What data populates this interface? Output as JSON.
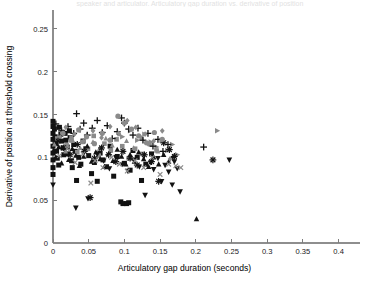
{
  "figure": {
    "width": 380,
    "height": 292,
    "background": "#ffffff",
    "top_caption": "speaker and articulator. Articulatory gap duration vs. derivative of position",
    "bottom_caption": ""
  },
  "plot_area": {
    "left": 53,
    "top": 10,
    "right": 360,
    "bottom": 243,
    "axis_color": "#8e8e8e"
  },
  "chart_data": {
    "type": "scatter",
    "title": "",
    "xlabel": "Articulatory gap duration (seconds)",
    "ylabel": "Derivative of position at threshold crossing",
    "xlim": [
      0,
      0.43
    ],
    "ylim": [
      0,
      0.272
    ],
    "xticks": [
      0,
      0.05,
      0.1,
      0.15,
      0.2,
      0.25,
      0.3,
      0.35,
      0.4
    ],
    "xticklabels": [
      "0",
      "0.05",
      "0.1",
      "0.15",
      "0.2",
      "0.25",
      "0.3",
      "0.35",
      "0.4"
    ],
    "yticks": [
      0,
      0.05,
      0.1,
      0.15,
      0.2,
      0.25
    ],
    "yticklabels": [
      "0",
      "0.05",
      "0.1",
      "0.15",
      "0.2",
      "0.25"
    ],
    "grid": false,
    "legend": "none",
    "marker_colors": {
      "black": "#121212",
      "gray": "#8a8a8a",
      "dark_gray": "#565656"
    },
    "series": [
      {
        "name": "square-black",
        "marker": "square",
        "color": "#121212",
        "size": 5.0,
        "points": [
          [
            0.0,
            0.142
          ],
          [
            0.0,
            0.136
          ],
          [
            0.0,
            0.128
          ],
          [
            0.0,
            0.121
          ],
          [
            0.0,
            0.113
          ],
          [
            0.0,
            0.105
          ],
          [
            0.0,
            0.097
          ],
          [
            0.0,
            0.088
          ],
          [
            0.0,
            0.08
          ],
          [
            0.002,
            0.133
          ],
          [
            0.003,
            0.124
          ],
          [
            0.004,
            0.116
          ],
          [
            0.005,
            0.107
          ],
          [
            0.006,
            0.099
          ],
          [
            0.008,
            0.091
          ],
          [
            0.009,
            0.135
          ],
          [
            0.011,
            0.127
          ],
          [
            0.012,
            0.119
          ],
          [
            0.014,
            0.111
          ],
          [
            0.015,
            0.103
          ],
          [
            0.017,
            0.128
          ],
          [
            0.018,
            0.12
          ],
          [
            0.02,
            0.112
          ],
          [
            0.021,
            0.104
          ],
          [
            0.023,
            0.131
          ],
          [
            0.024,
            0.123
          ],
          [
            0.026,
            0.096
          ],
          [
            0.027,
            0.088
          ],
          [
            0.029,
            0.115
          ],
          [
            0.031,
            0.107
          ],
          [
            0.033,
            0.073
          ],
          [
            0.036,
            0.1
          ],
          [
            0.039,
            0.092
          ],
          [
            0.042,
            0.119
          ],
          [
            0.046,
            0.11
          ],
          [
            0.05,
            0.102
          ],
          [
            0.054,
            0.081
          ],
          [
            0.058,
            0.094
          ],
          [
            0.062,
            0.072
          ],
          [
            0.066,
            0.105
          ],
          [
            0.07,
            0.097
          ],
          [
            0.075,
            0.089
          ],
          [
            0.08,
            0.113
          ],
          [
            0.085,
            0.078
          ],
          [
            0.09,
            0.101
          ],
          [
            0.095,
            0.048
          ],
          [
            0.098,
            0.046
          ],
          [
            0.1,
            0.093
          ],
          [
            0.103,
            0.046
          ],
          [
            0.106,
            0.047
          ],
          [
            0.108,
            0.085
          ],
          [
            0.112,
            0.108
          ],
          [
            0.118,
            0.1
          ],
          [
            0.124,
            0.073
          ],
          [
            0.13,
            0.092
          ],
          [
            0.138,
            0.104
          ]
        ]
      },
      {
        "name": "square-gray",
        "marker": "square",
        "color": "#8a8a8a",
        "size": 4.6,
        "points": [
          [
            0.006,
            0.122
          ],
          [
            0.013,
            0.13
          ],
          [
            0.019,
            0.114
          ],
          [
            0.026,
            0.123
          ],
          [
            0.034,
            0.106
          ],
          [
            0.041,
            0.118
          ],
          [
            0.049,
            0.11
          ],
          [
            0.057,
            0.125
          ],
          [
            0.064,
            0.102
          ],
          [
            0.072,
            0.116
          ],
          [
            0.081,
            0.108
          ],
          [
            0.089,
            0.121
          ],
          [
            0.097,
            0.113
          ],
          [
            0.106,
            0.099
          ],
          [
            0.115,
            0.11
          ],
          [
            0.125,
            0.104
          ],
          [
            0.135,
            0.116
          ],
          [
            0.145,
            0.108
          ]
        ]
      },
      {
        "name": "triangle-up-black",
        "marker": "triangle-up",
        "color": "#121212",
        "size": 5.2,
        "points": [
          [
            0.001,
            0.108
          ],
          [
            0.004,
            0.1
          ],
          [
            0.008,
            0.112
          ],
          [
            0.012,
            0.093
          ],
          [
            0.017,
            0.105
          ],
          [
            0.022,
            0.097
          ],
          [
            0.027,
            0.11
          ],
          [
            0.032,
            0.102
          ],
          [
            0.037,
            0.09
          ],
          [
            0.043,
            0.101
          ],
          [
            0.048,
            0.113
          ],
          [
            0.054,
            0.095
          ],
          [
            0.06,
            0.106
          ],
          [
            0.066,
            0.098
          ],
          [
            0.072,
            0.089
          ],
          [
            0.078,
            0.104
          ],
          [
            0.084,
            0.096
          ],
          [
            0.09,
            0.109
          ],
          [
            0.096,
            0.101
          ],
          [
            0.102,
            0.092
          ],
          [
            0.108,
            0.103
          ],
          [
            0.114,
            0.095
          ],
          [
            0.12,
            0.106
          ],
          [
            0.127,
            0.098
          ],
          [
            0.134,
            0.089
          ],
          [
            0.141,
            0.1
          ],
          [
            0.148,
            0.092
          ],
          [
            0.155,
            0.103
          ],
          [
            0.162,
            0.095
          ],
          [
            0.201,
            0.028
          ]
        ]
      },
      {
        "name": "triangle-up-gray",
        "marker": "triangle-up",
        "color": "#8a8a8a",
        "size": 4.8,
        "points": [
          [
            0.002,
            0.115
          ],
          [
            0.01,
            0.124
          ],
          [
            0.018,
            0.107
          ],
          [
            0.028,
            0.119
          ],
          [
            0.038,
            0.111
          ],
          [
            0.047,
            0.126
          ],
          [
            0.056,
            0.118
          ],
          [
            0.065,
            0.11
          ],
          [
            0.074,
            0.122
          ],
          [
            0.083,
            0.114
          ],
          [
            0.093,
            0.127
          ],
          [
            0.103,
            0.119
          ],
          [
            0.113,
            0.111
          ],
          [
            0.124,
            0.123
          ],
          [
            0.136,
            0.115
          ],
          [
            0.147,
            0.107
          ]
        ]
      },
      {
        "name": "triangle-down-black",
        "marker": "triangle-down",
        "color": "#121212",
        "size": 5.4,
        "points": [
          [
            0.0,
            0.068
          ],
          [
            0.032,
            0.041
          ],
          [
            0.049,
            0.052
          ],
          [
            0.062,
            0.104
          ],
          [
            0.071,
            0.096
          ],
          [
            0.079,
            0.087
          ],
          [
            0.088,
            0.1
          ],
          [
            0.097,
            0.092
          ],
          [
            0.105,
            0.084
          ],
          [
            0.113,
            0.097
          ],
          [
            0.121,
            0.089
          ],
          [
            0.129,
            0.056
          ],
          [
            0.137,
            0.094
          ],
          [
            0.141,
            0.086
          ],
          [
            0.147,
            0.099
          ],
          [
            0.152,
            0.072
          ],
          [
            0.157,
            0.091
          ],
          [
            0.162,
            0.083
          ],
          [
            0.167,
            0.068
          ],
          [
            0.17,
            0.095
          ],
          [
            0.174,
            0.087
          ],
          [
            0.178,
            0.06
          ],
          [
            0.247,
            0.097
          ]
        ]
      },
      {
        "name": "triangle-right-gray",
        "marker": "triangle-right",
        "color": "#8a8a8a",
        "size": 5.2,
        "points": [
          [
            0.097,
            0.124
          ],
          [
            0.108,
            0.131
          ],
          [
            0.118,
            0.12
          ],
          [
            0.128,
            0.127
          ],
          [
            0.137,
            0.118
          ],
          [
            0.145,
            0.112
          ],
          [
            0.152,
            0.12
          ],
          [
            0.16,
            0.108
          ],
          [
            0.167,
            0.115
          ],
          [
            0.174,
            0.103
          ],
          [
            0.23,
            0.131
          ]
        ]
      },
      {
        "name": "plus-black",
        "marker": "plus",
        "color": "#121212",
        "size": 5.6,
        "points": [
          [
            0.004,
            0.139
          ],
          [
            0.012,
            0.131
          ],
          [
            0.021,
            0.136
          ],
          [
            0.029,
            0.128
          ],
          [
            0.033,
            0.151
          ],
          [
            0.038,
            0.133
          ],
          [
            0.043,
            0.14
          ],
          [
            0.048,
            0.126
          ],
          [
            0.055,
            0.134
          ],
          [
            0.062,
            0.143
          ],
          [
            0.069,
            0.129
          ],
          [
            0.076,
            0.137
          ],
          [
            0.083,
            0.122
          ],
          [
            0.09,
            0.13
          ],
          [
            0.096,
            0.146
          ],
          [
            0.1,
            0.14
          ],
          [
            0.106,
            0.133
          ],
          [
            0.112,
            0.126
          ],
          [
            0.119,
            0.134
          ],
          [
            0.126,
            0.12
          ],
          [
            0.133,
            0.128
          ],
          [
            0.14,
            0.113
          ],
          [
            0.147,
            0.121
          ],
          [
            0.154,
            0.107
          ],
          [
            0.161,
            0.115
          ],
          [
            0.168,
            0.1
          ],
          [
            0.211,
            0.112
          ]
        ]
      },
      {
        "name": "star-black",
        "marker": "star",
        "color": "#121212",
        "size": 5.4,
        "points": [
          [
            0.007,
            0.119
          ],
          [
            0.015,
            0.111
          ],
          [
            0.024,
            0.103
          ],
          [
            0.034,
            0.115
          ],
          [
            0.044,
            0.107
          ],
          [
            0.052,
            0.053
          ],
          [
            0.058,
            0.099
          ],
          [
            0.068,
            0.111
          ],
          [
            0.078,
            0.103
          ],
          [
            0.088,
            0.095
          ],
          [
            0.098,
            0.107
          ],
          [
            0.108,
            0.099
          ],
          [
            0.118,
            0.091
          ],
          [
            0.128,
            0.103
          ],
          [
            0.138,
            0.095
          ],
          [
            0.148,
            0.072
          ],
          [
            0.155,
            0.117
          ],
          [
            0.163,
            0.109
          ],
          [
            0.17,
            0.101
          ],
          [
            0.224,
            0.097
          ]
        ]
      },
      {
        "name": "x-gray",
        "marker": "x",
        "color": "#8a8a8a",
        "size": 4.8,
        "points": [
          [
            0.009,
            0.102
          ],
          [
            0.02,
            0.11
          ],
          [
            0.031,
            0.094
          ],
          [
            0.042,
            0.104
          ],
          [
            0.053,
            0.07
          ],
          [
            0.059,
            0.096
          ],
          [
            0.07,
            0.088
          ],
          [
            0.082,
            0.1
          ],
          [
            0.093,
            0.092
          ],
          [
            0.104,
            0.084
          ],
          [
            0.115,
            0.096
          ],
          [
            0.127,
            0.088
          ],
          [
            0.139,
            0.1
          ],
          [
            0.15,
            0.08
          ],
          [
            0.162,
            0.092
          ],
          [
            0.172,
            0.09
          ],
          [
            0.179,
            0.088
          ]
        ]
      },
      {
        "name": "circle-gray",
        "marker": "circle",
        "color": "#8a8a8a",
        "size": 5.2,
        "points": [
          [
            0.014,
            0.128
          ],
          [
            0.025,
            0.12
          ],
          [
            0.036,
            0.132
          ],
          [
            0.047,
            0.124
          ],
          [
            0.058,
            0.116
          ],
          [
            0.069,
            0.128
          ],
          [
            0.08,
            0.12
          ],
          [
            0.091,
            0.148
          ],
          [
            0.1,
            0.14
          ],
          [
            0.11,
            0.133
          ],
          [
            0.12,
            0.125
          ],
          [
            0.131,
            0.117
          ],
          [
            0.142,
            0.129
          ],
          [
            0.153,
            0.121
          ]
        ]
      },
      {
        "name": "diamond-gray",
        "marker": "diamond",
        "color": "#8a8a8a",
        "size": 5.0,
        "points": [
          [
            0.018,
            0.135
          ],
          [
            0.03,
            0.127
          ],
          [
            0.043,
            0.119
          ],
          [
            0.056,
            0.131
          ],
          [
            0.068,
            0.123
          ],
          [
            0.08,
            0.136
          ],
          [
            0.092,
            0.128
          ],
          [
            0.104,
            0.143
          ],
          [
            0.116,
            0.135
          ],
          [
            0.129,
            0.127
          ],
          [
            0.141,
            0.119
          ],
          [
            0.153,
            0.131
          ],
          [
            0.164,
            0.098
          ]
        ]
      }
    ]
  }
}
